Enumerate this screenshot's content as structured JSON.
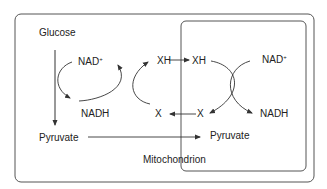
{
  "diagram": {
    "labels": {
      "glucose": "Glucose",
      "pyruvate_cyto": "Pyruvate",
      "pyruvate_mito": "Pyruvate",
      "nad_plus_left": "NAD",
      "nad_plus_left_sup": "+",
      "nadh_left": "NADH",
      "xh_left": "XH",
      "x_left": "X",
      "xh_right": "XH",
      "x_right": "X",
      "nad_plus_right": "NAD",
      "nad_plus_right_sup": "+",
      "nadh_right": "NADH",
      "mitochondrion": "Mitochondrion"
    },
    "colors": {
      "stroke": "#333333",
      "box": "#555555",
      "text": "#222222"
    }
  }
}
